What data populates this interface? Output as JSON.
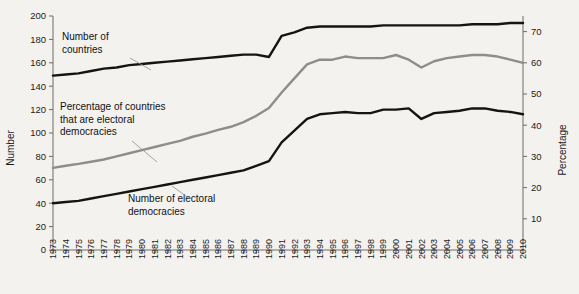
{
  "chart_data": {
    "type": "line",
    "title": "",
    "xlabel": "",
    "ylabel": "Number",
    "y2label": "Percentage",
    "grid": false,
    "legend": "annotations-inline",
    "ylim": [
      0,
      200
    ],
    "y2lim": [
      0,
      75
    ],
    "yticks": [
      0,
      20,
      40,
      60,
      80,
      100,
      120,
      140,
      160,
      180,
      200
    ],
    "y2ticks": [
      10,
      20,
      30,
      40,
      50,
      60,
      70
    ],
    "categories": [
      "1973",
      "1974",
      "1975",
      "1976",
      "1977",
      "1978",
      "1979",
      "1980",
      "1981",
      "1982",
      "1983",
      "1984",
      "1985",
      "1986",
      "1987",
      "1988",
      "1989",
      "1990",
      "1991",
      "1992",
      "1993",
      "1994",
      "1995",
      "1996",
      "1997",
      "1998",
      "1999",
      "2000",
      "2001",
      "2002",
      "2003",
      "2004",
      "2005",
      "2006",
      "2007",
      "2008",
      "2009",
      "2010"
    ],
    "series": [
      {
        "name": "Number of countries",
        "axis": "left",
        "color": "#141414",
        "values": [
          149,
          150,
          151,
          153,
          155,
          156,
          158,
          159,
          160,
          161,
          162,
          163,
          164,
          165,
          166,
          167,
          167,
          165,
          183,
          186,
          190,
          191,
          191,
          191,
          191,
          191,
          192,
          192,
          192,
          192,
          192,
          192,
          192,
          193,
          193,
          193,
          194,
          194
        ]
      },
      {
        "name": "Percentage of countries that are electoral democracies",
        "axis": "right",
        "color": "#8d8d8d",
        "values": [
          26.3,
          27.0,
          27.6,
          28.3,
          29.0,
          30.0,
          31.0,
          32.0,
          33.0,
          34.0,
          35.0,
          36.3,
          37.3,
          38.5,
          39.5,
          41.0,
          43.0,
          45.5,
          50.5,
          55.0,
          59.5,
          61.0,
          61.0,
          62.0,
          61.5,
          61.5,
          61.5,
          62.5,
          61.0,
          58.5,
          60.5,
          61.5,
          62.0,
          62.5,
          62.5,
          62.0,
          61.0,
          60.0
        ]
      },
      {
        "name": "Number of electoral democracies",
        "axis": "left",
        "color": "#141414",
        "values": [
          40,
          41,
          42,
          44,
          46,
          48,
          50,
          52,
          54,
          56,
          58,
          60,
          62,
          64,
          66,
          68,
          72,
          76,
          92,
          102,
          112,
          116,
          117,
          118,
          117,
          117,
          120,
          120,
          121,
          112,
          117,
          118,
          119,
          121,
          121,
          119,
          118,
          116
        ]
      }
    ],
    "annotations": [
      {
        "id": "annot-countries",
        "lines": [
          "Number of",
          "countries"
        ],
        "x": 62,
        "y": 40
      },
      {
        "id": "annot-percentage",
        "lines": [
          "Percentage of countries",
          "that are electoral",
          "democracies"
        ],
        "x": 60,
        "y": 110
      },
      {
        "id": "annot-democracies",
        "lines": [
          "Number of electoral",
          "democracies"
        ],
        "x": 128,
        "y": 202
      }
    ]
  }
}
